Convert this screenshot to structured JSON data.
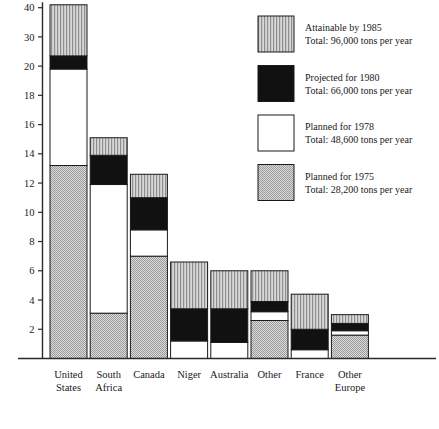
{
  "chart_data": {
    "type": "bar",
    "stacked": true,
    "title": "",
    "subtitle": "",
    "xlabel": "",
    "ylabel": "",
    "grid": false,
    "legend_position": "right-top",
    "categories": [
      "United States",
      "South Africa",
      "Canada",
      "Niger",
      "Australia",
      "Other",
      "France",
      "Other Europe"
    ],
    "category_lines": [
      [
        "United",
        "States"
      ],
      [
        "South",
        "Africa"
      ],
      [
        "Canada"
      ],
      [
        "Niger"
      ],
      [
        "Australia"
      ],
      [
        "Other"
      ],
      [
        "France"
      ],
      [
        "Other",
        "Europe"
      ]
    ],
    "y_tick_labels": [
      "2",
      "4",
      "6",
      "8",
      "10",
      "12",
      "14",
      "16",
      "18",
      "20",
      "30",
      "40"
    ],
    "y_tick_values": [
      2,
      4,
      6,
      8,
      10,
      12,
      14,
      16,
      18,
      20,
      30,
      40
    ],
    "y_axis_note": "scale compressed above 20",
    "ylim": [
      0,
      41.5
    ],
    "series": [
      {
        "name": "Planned for 1975",
        "fill": "checker-gray",
        "color": "#c9c9c9",
        "values": [
          13.2,
          3.1,
          7.0,
          0.0,
          0.0,
          2.6,
          0.0,
          1.6
        ]
      },
      {
        "name": "Planned for 1978",
        "fill": "solid-white",
        "color": "#ffffff",
        "values": [
          6.6,
          8.8,
          1.8,
          1.2,
          1.1,
          0.6,
          0.6,
          0.3
        ]
      },
      {
        "name": "Projected for 1980",
        "fill": "solid-black",
        "color": "#111111",
        "values": [
          3.7,
          2.0,
          2.2,
          2.2,
          2.3,
          0.7,
          1.4,
          0.5
        ]
      },
      {
        "name": "Attainable by 1985",
        "fill": "vertical-lines",
        "color": "#bdbdbd",
        "values": [
          17.5,
          1.2,
          1.6,
          3.2,
          2.6,
          2.1,
          2.4,
          0.6
        ]
      }
    ],
    "totals_visible": [
      41.0,
      15.1,
      12.6,
      6.6,
      6.0,
      6.0,
      4.4,
      3.0
    ]
  },
  "legend": {
    "items": [
      {
        "swatch": "vertical-lines",
        "line1": "Attainable by 1985",
        "line2": "Total: 96,000 tons per year"
      },
      {
        "swatch": "solid-black",
        "line1": "Projected for 1980",
        "line2": "Total: 66,000 tons per year"
      },
      {
        "swatch": "solid-white",
        "line1": "Planned for 1978",
        "line2": "Total: 48,600 tons per year"
      },
      {
        "swatch": "checker-gray",
        "line1": "Planned for 1975",
        "line2": "Total: 28,200 tons per year"
      }
    ]
  },
  "colors": {
    "ink": "#1a1a1a",
    "background": "#ffffff",
    "hatch_gray": "#c9c9c9",
    "line_gray": "#bdbdbd",
    "black_fill": "#111111",
    "white_fill": "#ffffff"
  }
}
